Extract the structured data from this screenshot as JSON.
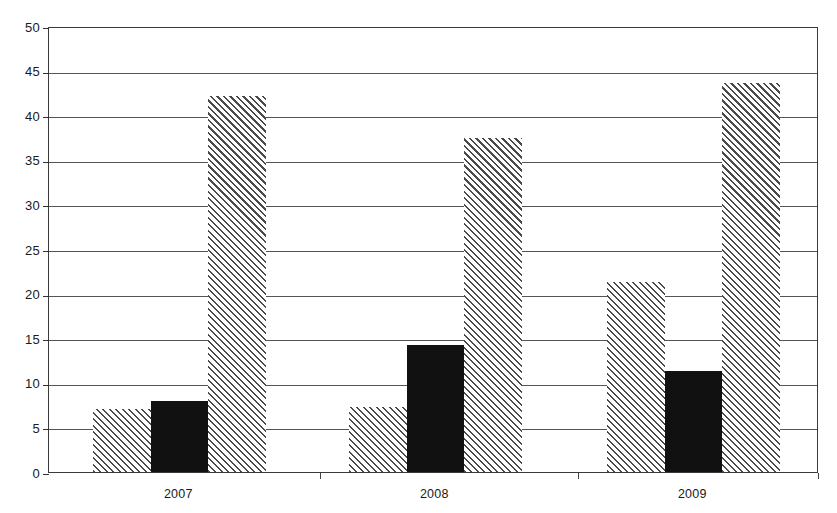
{
  "chart_data": {
    "type": "bar",
    "title": "",
    "subtitle": "",
    "xlabel": "",
    "ylabel": "",
    "categories": [
      "2007",
      "2008",
      "2009"
    ],
    "ylim": [
      0,
      50
    ],
    "y_ticks": [
      0,
      5,
      10,
      15,
      20,
      25,
      30,
      35,
      40,
      45,
      50
    ],
    "y_tick_labels": [
      "0",
      "5",
      "10",
      "15",
      "20",
      "25",
      "30",
      "35",
      "40",
      "45",
      "50"
    ],
    "grid": true,
    "legend": false,
    "legend_position": "none",
    "series": [
      {
        "name": "Series 1",
        "style": "hatched",
        "color": "#4a4a4a",
        "values": [
          7.1,
          7.3,
          21.3
        ]
      },
      {
        "name": "Series 2",
        "style": "solid-black",
        "color": "#111111",
        "values": [
          8.0,
          14.2,
          11.3
        ]
      },
      {
        "name": "Series 3",
        "style": "hatched",
        "color": "#4a4a4a",
        "values": [
          42.2,
          37.4,
          43.6
        ]
      }
    ],
    "annotations": []
  }
}
